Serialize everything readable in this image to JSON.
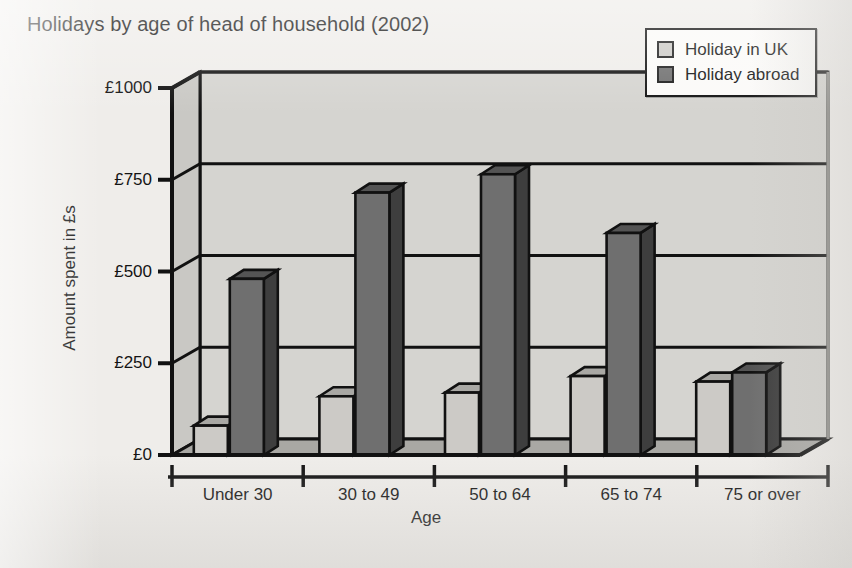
{
  "title": "Holidays by age of head of household (2002)",
  "axis_title_y": "Amount spent in £s",
  "axis_title_x": "Age",
  "legend": {
    "items": [
      {
        "label": "Holiday in UK",
        "color": "#cccac6",
        "swatch_name": "legend-swatch-uk"
      },
      {
        "label": "Holiday abroad",
        "color": "#6f6f6f",
        "swatch_name": "legend-swatch-abroad"
      }
    ]
  },
  "colors": {
    "page_background": "#efedea",
    "plot_background": "#d5d4d0",
    "floor": "#a9a8a4",
    "axis_line": "#111111",
    "uk_front": "#cccac6",
    "uk_top": "#a9a8a4",
    "uk_side": "#8e8d89",
    "abroad_front": "#6f6f6f",
    "abroad_top": "#545454",
    "abroad_side": "#3e3e3e"
  },
  "chart_data": {
    "type": "bar",
    "title": "Holidays by age of head of household (2002)",
    "xlabel": "Age",
    "ylabel": "Amount spent in £s",
    "ylim": [
      0,
      1000
    ],
    "yticks": [
      0,
      250,
      500,
      750,
      1000
    ],
    "ytick_labels": [
      "£0",
      "£250",
      "£500",
      "£750",
      "£1000"
    ],
    "grid": true,
    "legend_position": "top-right",
    "three_d": true,
    "categories": [
      "Under 30",
      "30 to 49",
      "50 to 64",
      "65 to 74",
      "75 or over"
    ],
    "series": [
      {
        "name": "Holiday in UK",
        "values": [
          80,
          160,
          170,
          215,
          200
        ]
      },
      {
        "name": "Holiday abroad",
        "values": [
          480,
          715,
          765,
          605,
          225
        ]
      }
    ]
  }
}
